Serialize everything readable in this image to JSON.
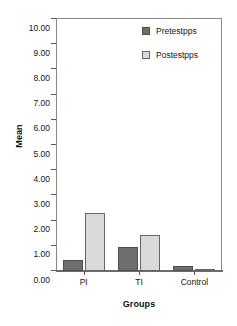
{
  "chart_data": {
    "type": "bar",
    "title": "",
    "subtitle": "",
    "xlabel": "Groups",
    "ylabel": "Mean",
    "categories": [
      "PI",
      "TI",
      "Control"
    ],
    "series": [
      {
        "name": "Pretestpps",
        "values": [
          0.45,
          0.95,
          0.2
        ],
        "color": "#6e6e6e"
      },
      {
        "name": "Postestpps",
        "values": [
          2.3,
          1.42,
          0.08
        ],
        "color": "#d9d9d9"
      }
    ],
    "ylim": [
      0.0,
      10.0
    ],
    "ytick_step": 1.0,
    "ytick_labels": [
      "10.00",
      "9.00",
      "8.00",
      "7.00",
      "6.00",
      "5.00",
      "4.00",
      "3.00",
      "2.00",
      "1.00",
      "0.00"
    ],
    "ytick_values": [
      10.0,
      9.0,
      8.0,
      7.0,
      6.0,
      5.0,
      4.0,
      3.0,
      2.0,
      1.0,
      0.0
    ],
    "grid": false,
    "legend_position": "top-right",
    "legend": [
      {
        "label": "Pretestpps",
        "color": "#6e6e6e"
      },
      {
        "label": "Postestpps",
        "color": "#d9d9d9"
      }
    ]
  },
  "axes": {
    "y_title": "Mean",
    "x_title": "Groups"
  },
  "colors": {
    "pretest": "#6e6e6e",
    "postest": "#d9d9d9",
    "frame": "#8a8a8a",
    "text": "#141414",
    "background": "#ffffff"
  }
}
